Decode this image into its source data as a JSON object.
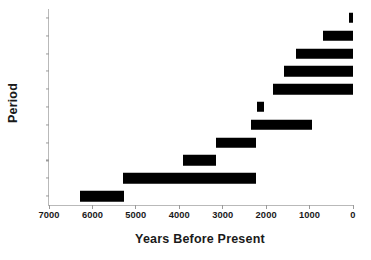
{
  "chart_data": {
    "type": "bar",
    "orientation": "horizontal",
    "subtype": "range-bar",
    "title": "",
    "xlabel": "Years Before Present",
    "ylabel": "Period",
    "xlim": [
      7000,
      0
    ],
    "x_reversed": true,
    "xticks": [
      7000,
      6000,
      5000,
      4000,
      3000,
      2000,
      1000,
      0
    ],
    "xtick_labels": [
      "7000",
      "6000",
      "5000",
      "4000",
      "3000",
      "2000",
      "1000",
      "0"
    ],
    "grid": false,
    "legend": null,
    "bar_color": "#000000",
    "axis_color": "#b9b9b9",
    "categories": [
      "LI",
      "EI",
      "BZ",
      "RO",
      "NB",
      "HE",
      "IR",
      "ML",
      "EB",
      "CH",
      "PN"
    ],
    "category_order": "top-to-bottom",
    "series": [
      {
        "name": "Period range",
        "ranges": [
          {
            "category": "LI",
            "start": 100,
            "end": 0
          },
          {
            "category": "EI",
            "start": 690,
            "end": 0
          },
          {
            "category": "BZ",
            "start": 1310,
            "end": 0
          },
          {
            "category": "RO",
            "start": 1590,
            "end": 0
          },
          {
            "category": "NB",
            "start": 1840,
            "end": 0
          },
          {
            "category": "HE",
            "start": 2200,
            "end": 2050
          },
          {
            "category": "IR",
            "start": 2350,
            "end": 950
          },
          {
            "category": "ML",
            "start": 3150,
            "end": 2230
          },
          {
            "category": "EB",
            "start": 3910,
            "end": 3150
          },
          {
            "category": "CH",
            "start": 5290,
            "end": 2230
          },
          {
            "category": "PN",
            "start": 6280,
            "end": 5270
          }
        ]
      }
    ]
  }
}
